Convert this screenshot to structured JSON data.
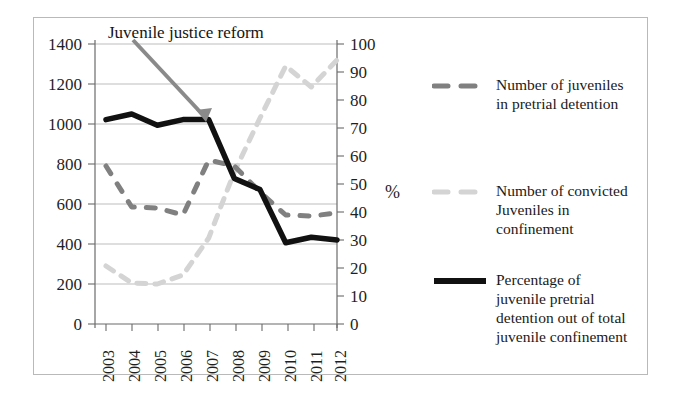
{
  "chart_data": {
    "type": "line",
    "title": "",
    "subtitle": "",
    "xlabel": "",
    "ylabel": "",
    "y2label": "%",
    "grid": true,
    "legend_position": "right",
    "categories": [
      "2003",
      "2004",
      "2005",
      "2006",
      "2007",
      "2008",
      "2009",
      "2010",
      "2011",
      "2012"
    ],
    "ylim": [
      0,
      1400
    ],
    "yticks": [
      0,
      200,
      400,
      600,
      800,
      1000,
      1200,
      1400
    ],
    "y2lim": [
      0,
      100
    ],
    "y2ticks": [
      0,
      10,
      20,
      30,
      40,
      50,
      60,
      70,
      80,
      90,
      100
    ],
    "series": [
      {
        "name": "Number of juveniles in pretrial detention",
        "axis": "left",
        "style": "dashed",
        "color": "#808080",
        "values": [
          790,
          585,
          580,
          545,
          820,
          790,
          660,
          545,
          540,
          555
        ]
      },
      {
        "name": "Number of convicted Juveniles in confinement",
        "axis": "left",
        "style": "dashed",
        "color": "#d4d4d4",
        "values": [
          290,
          205,
          200,
          245,
          430,
          760,
          1030,
          1290,
          1185,
          1320
        ]
      },
      {
        "name": "Percentage of juvenile pretrial detention out of total juvenile confinement",
        "axis": "right",
        "style": "solid",
        "color": "#111111",
        "values": [
          73,
          75,
          71,
          73,
          73,
          52,
          48,
          29,
          31,
          30
        ]
      }
    ],
    "annotations": [
      {
        "text": "Juvenile justice reform",
        "name": "juvenile-justice-reform-annotation",
        "arrow_from": [
          133,
          40
        ],
        "arrow_to": [
          206,
          119
        ],
        "color": "#808080"
      }
    ]
  },
  "legend": {
    "items": [
      {
        "label_line1": "Number of juveniles",
        "label_line2": "in pretrial detention",
        "label_line3": "",
        "label_line4": "",
        "swatch": "dashed-dark-gray-line-swatch",
        "color": "#808080"
      },
      {
        "label_line1": "Number of convicted",
        "label_line2": "Juveniles in",
        "label_line3": "confinement",
        "label_line4": "",
        "swatch": "dashed-light-gray-line-swatch",
        "color": "#d4d4d4"
      },
      {
        "label_line1": "Percentage of",
        "label_line2": "juvenile pretrial",
        "label_line3": "detention out of total",
        "label_line4": "juvenile confinement",
        "swatch": "solid-black-line-swatch",
        "color": "#111111"
      }
    ]
  },
  "axes": {
    "y_left_ticks": [
      "1400",
      "1200",
      "1000",
      "800",
      "600",
      "400",
      "200",
      "0"
    ],
    "y_right_ticks": [
      "100",
      "90",
      "80",
      "70",
      "60",
      "50",
      "40",
      "30",
      "20",
      "10",
      "0"
    ],
    "x_ticks": [
      "2003",
      "2004",
      "2005",
      "2006",
      "2007",
      "2008",
      "2009",
      "2010",
      "2011",
      "2012"
    ],
    "percent_unit": "%"
  }
}
